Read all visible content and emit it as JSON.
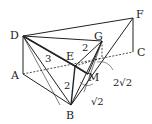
{
  "figure": {
    "type": "geometry-solid",
    "background": "#ffffff",
    "line_color": "#222222",
    "vertices": {
      "A": {
        "label": "A",
        "x": 23,
        "y": 74
      },
      "B": {
        "label": "B",
        "x": 71,
        "y": 105
      },
      "C": {
        "label": "C",
        "x": 133,
        "y": 52
      },
      "D": {
        "label": "D",
        "x": 23,
        "y": 36
      },
      "E": {
        "label": "E",
        "x": 75,
        "y": 66
      },
      "F": {
        "label": "F",
        "x": 133,
        "y": 18
      },
      "G": {
        "label": "G",
        "x": 102,
        "y": 41
      },
      "M": {
        "label": "M",
        "x": 88,
        "y": 74
      }
    },
    "measurements": {
      "DE": "3",
      "EG": "2",
      "EB": "2",
      "BM": "√2",
      "MC": "2√2"
    }
  }
}
